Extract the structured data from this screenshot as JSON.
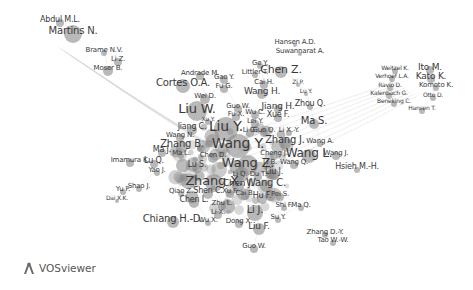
{
  "chart_data": {
    "type": "network",
    "title": "",
    "tool": "VOSviewer",
    "colors": {
      "node": "#8a8a8a",
      "edge": "#d6d6d6",
      "label": "#3a3a3a",
      "background": "#ffffff"
    },
    "clusters": [
      {
        "name": "upper-left",
        "center": [
          70,
          55
        ]
      },
      {
        "name": "right",
        "center": [
          408,
          90
        ]
      },
      {
        "name": "main",
        "center": [
          235,
          165
        ]
      }
    ],
    "nodes": [
      {
        "label": "Abdul M.L.",
        "x": 60,
        "y": 20,
        "size": 8,
        "r": 4
      },
      {
        "label": "Martins N.",
        "x": 73,
        "y": 31,
        "size": 10,
        "r": 9
      },
      {
        "label": "Brame N.V.",
        "x": 104,
        "y": 50,
        "size": 7,
        "r": 3
      },
      {
        "label": "Li Z.",
        "x": 118,
        "y": 59,
        "size": 7,
        "r": 4
      },
      {
        "label": "Moser B.",
        "x": 108,
        "y": 68,
        "size": 7,
        "r": 5
      },
      {
        "label": "Hansen A.D.",
        "x": 295,
        "y": 42,
        "size": 7,
        "r": 2
      },
      {
        "label": "Suwannarat A.",
        "x": 300,
        "y": 51,
        "size": 7,
        "r": 2
      },
      {
        "label": "Ge Y.",
        "x": 260,
        "y": 63,
        "size": 7,
        "r": 3
      },
      {
        "label": "Chen Z.",
        "x": 281,
        "y": 69,
        "size": 11,
        "r": 6
      },
      {
        "label": "Littler T.",
        "x": 255,
        "y": 72,
        "size": 7,
        "r": 3
      },
      {
        "label": "Cai H.",
        "x": 264,
        "y": 82,
        "size": 7,
        "r": 4
      },
      {
        "label": "Zi P.",
        "x": 298,
        "y": 82,
        "size": 6,
        "r": 2
      },
      {
        "label": "Lu Y.",
        "x": 306,
        "y": 91,
        "size": 6,
        "r": 2
      },
      {
        "label": "Wang H.",
        "x": 262,
        "y": 91,
        "size": 9,
        "r": 5
      },
      {
        "label": "Andrade M.",
        "x": 200,
        "y": 73,
        "size": 7,
        "r": 4
      },
      {
        "label": "Cortes O.A.",
        "x": 183,
        "y": 83,
        "size": 10,
        "r": 7
      },
      {
        "label": "Gao Y.",
        "x": 224,
        "y": 77,
        "size": 7,
        "r": 4
      },
      {
        "label": "Fu G.",
        "x": 224,
        "y": 86,
        "size": 7,
        "r": 4
      },
      {
        "label": "Wei D.",
        "x": 205,
        "y": 96,
        "size": 7,
        "r": 5
      },
      {
        "label": "Liu W.",
        "x": 197,
        "y": 108,
        "size": 13,
        "r": 10
      },
      {
        "label": "Jiang H.",
        "x": 278,
        "y": 106,
        "size": 9,
        "r": 4
      },
      {
        "label": "Zhou Q.",
        "x": 310,
        "y": 104,
        "size": 8,
        "r": 3
      },
      {
        "label": "Guo W.",
        "x": 238,
        "y": 106,
        "size": 7,
        "r": 4
      },
      {
        "label": "Fu X.",
        "x": 236,
        "y": 114,
        "size": 7,
        "r": 4
      },
      {
        "label": "Wu C.",
        "x": 255,
        "y": 112,
        "size": 7,
        "r": 4
      },
      {
        "label": "Xue F.",
        "x": 278,
        "y": 115,
        "size": 8,
        "r": 4
      },
      {
        "label": "Xu Y.",
        "x": 208,
        "y": 119,
        "size": 6,
        "r": 3
      },
      {
        "label": "Lei Y.",
        "x": 255,
        "y": 121,
        "size": 7,
        "r": 4
      },
      {
        "label": "Jiang C.",
        "x": 192,
        "y": 127,
        "size": 8,
        "r": 5
      },
      {
        "label": "Liu Y.",
        "x": 226,
        "y": 126,
        "size": 14,
        "r": 12
      },
      {
        "label": "Li G.",
        "x": 250,
        "y": 130,
        "size": 7,
        "r": 4
      },
      {
        "label": "Guo Q.",
        "x": 264,
        "y": 130,
        "size": 7,
        "r": 4
      },
      {
        "label": "Li X.-Y.",
        "x": 289,
        "y": 130,
        "size": 7,
        "r": 3
      },
      {
        "label": "Ma S.",
        "x": 314,
        "y": 121,
        "size": 10,
        "r": 5
      },
      {
        "label": "Wang N.",
        "x": 180,
        "y": 135,
        "size": 7,
        "r": 4
      },
      {
        "label": "Zhang B.",
        "x": 182,
        "y": 144,
        "size": 10,
        "r": 6
      },
      {
        "label": "Wang Y.",
        "x": 238,
        "y": 143,
        "size": 14,
        "r": 12
      },
      {
        "label": "Zhang J.",
        "x": 285,
        "y": 140,
        "size": 10,
        "r": 6
      },
      {
        "label": "Wang A.",
        "x": 320,
        "y": 141,
        "size": 7,
        "r": 3
      },
      {
        "label": "Ma J.",
        "x": 162,
        "y": 150,
        "size": 8,
        "r": 4
      },
      {
        "label": "Ma L.",
        "x": 181,
        "y": 153,
        "size": 7,
        "r": 3
      },
      {
        "label": "Chen D.",
        "x": 213,
        "y": 155,
        "size": 7,
        "r": 5
      },
      {
        "label": "Cheng J.",
        "x": 274,
        "y": 153,
        "size": 7,
        "r": 4
      },
      {
        "label": "Wang L.",
        "x": 309,
        "y": 153,
        "size": 12,
        "r": 7
      },
      {
        "label": "Wang J.",
        "x": 336,
        "y": 153,
        "size": 7,
        "r": 4
      },
      {
        "label": "Imamura K.",
        "x": 130,
        "y": 160,
        "size": 7,
        "r": 4
      },
      {
        "label": "Lu Q.",
        "x": 154,
        "y": 161,
        "size": 8,
        "r": 4
      },
      {
        "label": "Lu S.",
        "x": 197,
        "y": 165,
        "size": 8,
        "r": 5
      },
      {
        "label": "Wang Z.",
        "x": 248,
        "y": 162,
        "size": 13,
        "r": 10
      },
      {
        "label": "Li B.",
        "x": 270,
        "y": 162,
        "size": 7,
        "r": 4
      },
      {
        "label": "Wang Q.",
        "x": 294,
        "y": 162,
        "size": 7,
        "r": 4
      },
      {
        "label": "Hsieh M.-H.",
        "x": 357,
        "y": 167,
        "size": 8,
        "r": 3
      },
      {
        "label": "Yao J.",
        "x": 157,
        "y": 170,
        "size": 7,
        "r": 3
      },
      {
        "label": "Li Q.",
        "x": 240,
        "y": 174,
        "size": 7,
        "r": 4
      },
      {
        "label": "Du T.",
        "x": 258,
        "y": 174,
        "size": 7,
        "r": 4
      },
      {
        "label": "Liu J.",
        "x": 274,
        "y": 172,
        "size": 8,
        "r": 5
      },
      {
        "label": "Zhang X.",
        "x": 214,
        "y": 180,
        "size": 13,
        "r": 9
      },
      {
        "label": "Chen J.",
        "x": 238,
        "y": 183,
        "size": 9,
        "r": 6
      },
      {
        "label": "Wang C.",
        "x": 266,
        "y": 183,
        "size": 10,
        "r": 6
      },
      {
        "label": "Yu F.",
        "x": 123,
        "y": 189,
        "size": 7,
        "r": 3
      },
      {
        "label": "Shao J.",
        "x": 139,
        "y": 186,
        "size": 7,
        "r": 3
      },
      {
        "label": "Dai X.K.",
        "x": 117,
        "y": 198,
        "size": 6,
        "r": 2
      },
      {
        "label": "Qiao Z.",
        "x": 181,
        "y": 191,
        "size": 7,
        "r": 3
      },
      {
        "label": "Shen C.",
        "x": 208,
        "y": 191,
        "size": 8,
        "r": 5
      },
      {
        "label": "Xu F.",
        "x": 230,
        "y": 191,
        "size": 7,
        "r": 4
      },
      {
        "label": "Cai B.",
        "x": 245,
        "y": 193,
        "size": 7,
        "r": 4
      },
      {
        "label": "Hu F.",
        "x": 262,
        "y": 196,
        "size": 8,
        "r": 5
      },
      {
        "label": "Pei S.",
        "x": 280,
        "y": 194,
        "size": 7,
        "r": 4
      },
      {
        "label": "Chen L.",
        "x": 194,
        "y": 200,
        "size": 8,
        "r": 5
      },
      {
        "label": "Zhu L.",
        "x": 222,
        "y": 203,
        "size": 7,
        "r": 4
      },
      {
        "label": "Shi F.",
        "x": 284,
        "y": 205,
        "size": 7,
        "r": 3
      },
      {
        "label": "Ma Q.",
        "x": 301,
        "y": 205,
        "size": 7,
        "r": 3
      },
      {
        "label": "Li X.",
        "x": 218,
        "y": 212,
        "size": 7,
        "r": 4
      },
      {
        "label": "Li J.",
        "x": 255,
        "y": 210,
        "size": 10,
        "r": 8
      },
      {
        "label": "Chiang H.-D.",
        "x": 173,
        "y": 219,
        "size": 10,
        "r": 6
      },
      {
        "label": "Wu X.",
        "x": 208,
        "y": 220,
        "size": 7,
        "r": 3
      },
      {
        "label": "Dong X.",
        "x": 239,
        "y": 221,
        "size": 7,
        "r": 4
      },
      {
        "label": "Liu F.",
        "x": 259,
        "y": 226,
        "size": 9,
        "r": 6
      },
      {
        "label": "Su Y.",
        "x": 278,
        "y": 217,
        "size": 7,
        "r": 3
      },
      {
        "label": "Guo W.",
        "x": 254,
        "y": 246,
        "size": 7,
        "r": 4
      },
      {
        "label": "Zhang D.-Y.",
        "x": 325,
        "y": 232,
        "size": 7,
        "r": 3
      },
      {
        "label": "Tao W.-W.",
        "x": 333,
        "y": 240,
        "size": 7,
        "r": 3
      },
      {
        "label": "Weitzel K.",
        "x": 395,
        "y": 68,
        "size": 6,
        "r": 3
      },
      {
        "label": "Ito M.",
        "x": 430,
        "y": 67,
        "size": 9,
        "r": 4
      },
      {
        "label": "Verhoef L.A.",
        "x": 392,
        "y": 76,
        "size": 6,
        "r": 3
      },
      {
        "label": "Kato K.",
        "x": 431,
        "y": 76,
        "size": 9,
        "r": 4
      },
      {
        "label": "Ravio D.",
        "x": 390,
        "y": 85,
        "size": 6,
        "r": 3
      },
      {
        "label": "Komoto K.",
        "x": 436,
        "y": 85,
        "size": 7,
        "r": 3
      },
      {
        "label": "Kalenbach G.",
        "x": 389,
        "y": 93,
        "size": 6,
        "r": 3
      },
      {
        "label": "Otto D.",
        "x": 433,
        "y": 95,
        "size": 6,
        "r": 3
      },
      {
        "label": "Beneking C.",
        "x": 394,
        "y": 101,
        "size": 6,
        "r": 3
      },
      {
        "label": "Hansen T.",
        "x": 422,
        "y": 108,
        "size": 6,
        "r": 3
      }
    ]
  },
  "logo": {
    "icon": "vosviewer-logo-icon",
    "text": "VOSviewer"
  }
}
